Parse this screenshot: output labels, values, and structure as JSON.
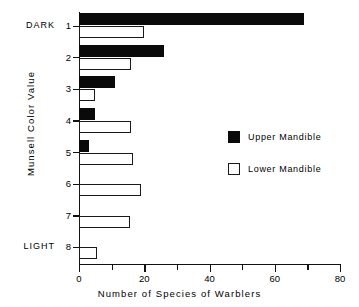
{
  "chart_data": {
    "type": "bar",
    "orientation": "horizontal",
    "title": "",
    "xlabel": "Number of Species of Warblers",
    "ylabel": "Munsell Color Value",
    "categories": [
      "1",
      "2",
      "3",
      "4",
      "5",
      "6",
      "7",
      "8"
    ],
    "category_end_labels": {
      "first": "DARK",
      "last": "LIGHT"
    },
    "xlim": [
      0,
      80
    ],
    "xticks": [
      0,
      20,
      40,
      60,
      80
    ],
    "xtick_labels": [
      "0",
      "20",
      "40",
      "60",
      "80"
    ],
    "xminorticks": [
      10,
      30,
      50,
      70
    ],
    "grid": false,
    "legend_position": "center-right",
    "series": [
      {
        "name": "Upper Mandible",
        "fill": "#0a0a0a",
        "style": "filled",
        "values": [
          69,
          26,
          11,
          5,
          3,
          0,
          0,
          0
        ]
      },
      {
        "name": "Lower Mandible",
        "fill": "#ffffff",
        "style": "open",
        "values": [
          20,
          16,
          5,
          16,
          16.5,
          19,
          15.5,
          5.5
        ]
      }
    ]
  },
  "legend": {
    "entries": [
      {
        "label": "Upper Mandible",
        "swatch": "filled"
      },
      {
        "label": "Lower Mandible",
        "swatch": "open"
      }
    ]
  }
}
